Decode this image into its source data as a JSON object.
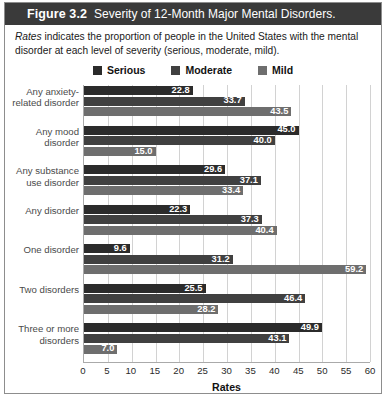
{
  "figure": {
    "number": "Figure 3.2",
    "title": "Severity of 12-Month Major Mental Disorders.",
    "caption_italic": "Rates",
    "caption_rest": " indicates the proportion of people in the United States with the mental disorder at each level of severity (serious, moderate, mild)."
  },
  "colors": {
    "serious": "#2b2b2b",
    "moderate": "#404040",
    "mild": "#6e6e6e",
    "header_bg": "#3a3a3a",
    "grid": "#d2d2d2",
    "axis": "#aaaaaa"
  },
  "chart_data": {
    "type": "bar",
    "orientation": "horizontal",
    "title": "Severity of 12-Month Major Mental Disorders.",
    "xlabel": "Rates",
    "ylabel": "",
    "xlim": [
      0,
      60
    ],
    "xticks": [
      0,
      5,
      10,
      15,
      20,
      25,
      30,
      35,
      40,
      45,
      50,
      55,
      60
    ],
    "grid": true,
    "legend_position": "top",
    "categories": [
      "Any anxiety-related disorder",
      "Any mood disorder",
      "Any substance use disorder",
      "Any disorder",
      "One disorder",
      "Two disorders",
      "Three or more disorders"
    ],
    "series": [
      {
        "name": "Serious",
        "color": "#2b2b2b",
        "values": [
          22.8,
          45.0,
          29.6,
          22.3,
          9.6,
          25.5,
          49.9
        ]
      },
      {
        "name": "Moderate",
        "color": "#404040",
        "values": [
          33.7,
          40.0,
          37.1,
          37.3,
          31.2,
          46.4,
          43.1
        ]
      },
      {
        "name": "Mild",
        "color": "#6e6e6e",
        "values": [
          43.5,
          15.0,
          33.4,
          40.4,
          59.2,
          28.2,
          7.0
        ]
      }
    ]
  }
}
